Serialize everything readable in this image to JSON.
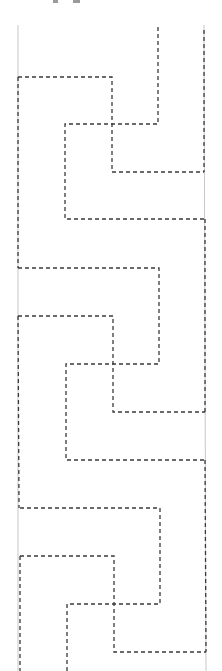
{
  "diagram": {
    "width": 222,
    "height": 671,
    "colors": {
      "background": "#ffffff",
      "border": "#c8c8c8",
      "dashed": "#3a3a3a"
    },
    "borders": [
      {
        "x1": 18,
        "y1": 25,
        "x2": 18,
        "y2": 671
      },
      {
        "x1": 204,
        "y1": 25,
        "x2": 206,
        "y2": 671
      }
    ],
    "dashed_paths": [
      {
        "name": "unit1-path-a",
        "points": "158,27 158,124 65,124 65,219 204,219"
      },
      {
        "name": "unit1-path-b",
        "points": "18,77 112,77 112,172 204,172"
      },
      {
        "name": "right-dashed-top",
        "points": "204,30 204,172"
      },
      {
        "name": "left-dashed-1",
        "points": "18,77 18,268"
      },
      {
        "name": "unit2-path-a",
        "points": "18,268 159,268 159,364 66,364 66,460 205,460"
      },
      {
        "name": "unit2-path-b",
        "points": "18,316 113,316 113,412 205,412"
      },
      {
        "name": "right-dashed-2",
        "points": "205,219 205,412"
      },
      {
        "name": "left-dashed-2",
        "points": "18,316 19,508"
      },
      {
        "name": "unit3-path-a",
        "points": "20,508 160,508 160,604 67,604 67,671"
      },
      {
        "name": "unit3-path-b",
        "points": "20,556 114,556 114,652 206,652"
      },
      {
        "name": "right-dashed-3",
        "points": "205,460 206,652"
      },
      {
        "name": "left-dashed-3",
        "points": "20,556 20,671"
      }
    ]
  }
}
